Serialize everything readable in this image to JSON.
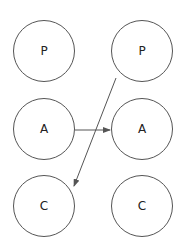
{
  "nodes": [
    {
      "id": "p-left",
      "label": "P",
      "cx": 44,
      "cy": 51
    },
    {
      "id": "p-right",
      "label": "P",
      "cx": 142,
      "cy": 51
    },
    {
      "id": "a-left",
      "label": "A",
      "cx": 44,
      "cy": 129
    },
    {
      "id": "a-right",
      "label": "A",
      "cx": 142,
      "cy": 129
    },
    {
      "id": "c-left",
      "label": "C",
      "cx": 44,
      "cy": 206
    },
    {
      "id": "c-right",
      "label": "C",
      "cx": 142,
      "cy": 206
    }
  ],
  "edges": [
    {
      "from": "a-left",
      "to": "a-right"
    },
    {
      "from": "p-right",
      "to": "c-left"
    }
  ],
  "colors": {
    "stroke": "#555555",
    "text": "#222222"
  }
}
